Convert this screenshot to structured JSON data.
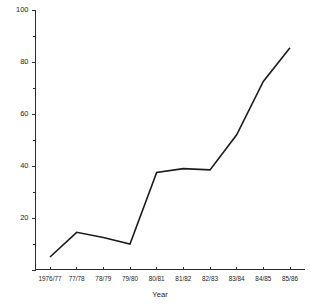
{
  "chart_data": {
    "type": "line",
    "title": "",
    "xlabel": "Year",
    "ylabel": "",
    "categories": [
      "1976/77",
      "77/78",
      "78/79",
      "79/80",
      "80/81",
      "81/82",
      "82/83",
      "83/84",
      "84/85",
      "85/86"
    ],
    "values": [
      5,
      14.5,
      12.5,
      10,
      37.5,
      39,
      38.5,
      52,
      72.5,
      85.5
    ],
    "series": [
      {
        "name": "",
        "values": [
          5,
          14.5,
          12.5,
          10,
          37.5,
          39,
          38.5,
          52,
          72.5,
          85.5
        ]
      }
    ],
    "ylim": [
      0,
      100
    ],
    "ytick_values": [
      0,
      20,
      40,
      60,
      80,
      100
    ],
    "ytick_labels": [
      "",
      "20",
      "40",
      "60",
      "80",
      "100"
    ],
    "yminor_tick_values": [
      10,
      30,
      50,
      70,
      90
    ],
    "grid": false,
    "legend": false,
    "legend_position": "none",
    "line_color": "#1c1c1c",
    "axis_color": "#2b2b2b",
    "background_color": "#ffffff"
  },
  "axis": {
    "x_title": "Year",
    "y_labels": [
      "100",
      "80",
      "60",
      "40",
      "20"
    ],
    "x_labels": [
      "1976/77",
      "77/78",
      "78/79",
      "79/80",
      "80/81",
      "81/82",
      "82/83",
      "83/84",
      "84/85",
      "85/86"
    ]
  }
}
